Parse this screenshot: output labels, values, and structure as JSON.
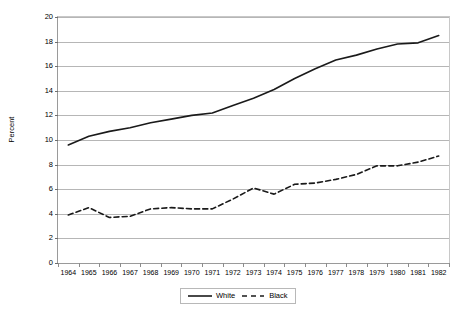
{
  "chart_data": {
    "type": "line",
    "title": "",
    "xlabel": "",
    "ylabel": "Percent",
    "x": [
      1964,
      1965,
      1966,
      1967,
      1968,
      1969,
      1970,
      1971,
      1972,
      1973,
      1974,
      1975,
      1976,
      1977,
      1978,
      1979,
      1980,
      1981,
      1982
    ],
    "categories": [
      "1964",
      "1965",
      "1966",
      "1967",
      "1968",
      "1969",
      "1970",
      "1971",
      "1972",
      "1973",
      "1974",
      "1975",
      "1976",
      "1977",
      "1978",
      "1979",
      "1980",
      "1981",
      "1982"
    ],
    "series": [
      {
        "name": "White",
        "style": "solid",
        "color": "#1a1a1a",
        "values": [
          9.6,
          10.3,
          10.7,
          11.0,
          11.4,
          11.7,
          12.0,
          12.2,
          12.8,
          13.4,
          14.1,
          15.0,
          15.8,
          16.5,
          16.9,
          17.4,
          17.8,
          17.9,
          18.5
        ]
      },
      {
        "name": "Black",
        "style": "dashed",
        "color": "#1a1a1a",
        "values": [
          3.9,
          4.5,
          3.7,
          3.8,
          4.4,
          4.5,
          4.4,
          4.4,
          5.2,
          6.1,
          5.6,
          6.4,
          6.5,
          6.8,
          7.2,
          7.9,
          7.9,
          8.2,
          8.7
        ]
      }
    ],
    "ylim": [
      0,
      20
    ],
    "ytick_step": 2,
    "yticks": [
      "0",
      "2",
      "4",
      "6",
      "8",
      "10",
      "12",
      "14",
      "16",
      "18",
      "20"
    ],
    "grid": "horizontal",
    "legend_position": "bottom",
    "gridline_color": "#b6b6b6",
    "axis_color": "#9a9a9a",
    "background": "#ffffff"
  },
  "legend": {
    "items": [
      {
        "label": "White"
      },
      {
        "label": "Black"
      }
    ]
  },
  "axis": {
    "y_title": "Percent"
  }
}
